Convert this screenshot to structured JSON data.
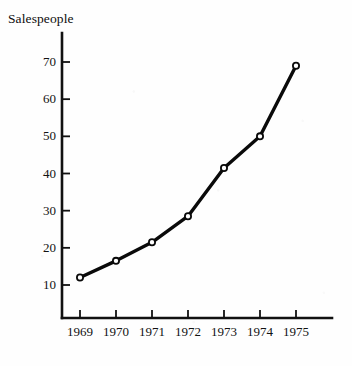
{
  "chart_data": {
    "type": "line",
    "title": "Salespeople",
    "xlabel": "",
    "ylabel": "Salespeople",
    "categories": [
      "1969",
      "1970",
      "1971",
      "1972",
      "1973",
      "1974",
      "1975"
    ],
    "x": [
      1969,
      1970,
      1971,
      1972,
      1973,
      1974,
      1975
    ],
    "values": [
      12,
      16.5,
      21.5,
      28.5,
      41.5,
      50,
      69
    ],
    "series": [
      {
        "name": "Salespeople",
        "values": [
          12,
          16.5,
          21.5,
          28.5,
          41.5,
          50,
          69
        ]
      }
    ],
    "ylim": [
      0,
      75
    ],
    "xlim": [
      1968.5,
      1975.8
    ],
    "yticks": [
      10,
      20,
      30,
      40,
      50,
      60,
      70
    ],
    "ytick_labels": [
      "10",
      "20",
      "30",
      "40",
      "50",
      "60",
      "70"
    ],
    "xticks": [
      1969,
      1970,
      1971,
      1972,
      1973,
      1974,
      1975
    ],
    "xtick_labels": [
      "1969",
      "1970",
      "1971",
      "1972",
      "1973",
      "1974",
      "1975"
    ],
    "grid": false,
    "legend": false,
    "legend_position": "none",
    "marker": "open-circle",
    "line_color": "#0a0a0a",
    "marker_face_color": "#ffffff",
    "marker_edge_color": "#0a0a0a",
    "axis_color": "#111111",
    "background_color": "#fefefe",
    "annotations": []
  }
}
